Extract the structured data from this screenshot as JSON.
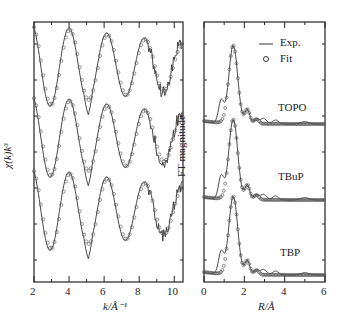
{
  "chart_data": [
    {
      "type": "line",
      "panel": "left",
      "xlabel": "k/Å⁻¹",
      "ylabel": "χ(k)k³",
      "xlim": [
        2,
        10.5
      ],
      "x_ticks": [
        "2",
        "4",
        "6",
        "8",
        "10"
      ],
      "series_note": "Three stacked EXAFS oscillations (TOPO top, TBuP middle, TBP bottom); solid line = Exp., circles = Fit",
      "peaks_k": [
        4.0,
        6.2,
        8.1,
        10.0
      ],
      "troughs_k": [
        2.9,
        5.1,
        7.2,
        9.2
      ]
    },
    {
      "type": "line",
      "panel": "right",
      "xlabel": "R/Å",
      "ylabel": "FT magnitude",
      "xlim": [
        0,
        6
      ],
      "x_ticks": [
        "0",
        "2",
        "4",
        "6"
      ],
      "legend": [
        {
          "style": "line",
          "label": "Exp."
        },
        {
          "style": "circle",
          "label": "Fit"
        }
      ],
      "annotations": [
        "TOPO",
        "TBuP",
        "TBP"
      ],
      "main_peak_R": 1.45,
      "secondary_peak_R": 2.15,
      "shoulder_R": 0.85
    }
  ],
  "labels": {
    "left_xlabel": "k/Å⁻¹",
    "left_ylabel": "χ(k)k³",
    "right_xlabel": "R/Å",
    "right_ylabel": "FT magnitude",
    "legend_exp": "Exp.",
    "legend_fit": "Fit",
    "topo": "TOPO",
    "tbup": "TBuP",
    "tbp": "TBP",
    "lt": [
      "2",
      "4",
      "6",
      "8",
      "10"
    ],
    "rt": [
      "0",
      "2",
      "4",
      "6"
    ]
  }
}
